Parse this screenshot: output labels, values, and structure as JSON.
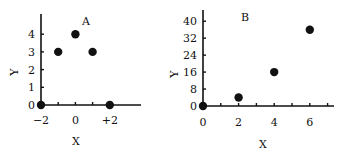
{
  "chart_data": [
    {
      "type": "scatter",
      "title": "A",
      "xlabel": "X",
      "ylabel": "Y",
      "x": [
        -2,
        -1,
        0,
        1,
        2
      ],
      "y": [
        0,
        3,
        4,
        3,
        0
      ],
      "xticks": [
        -2,
        -1,
        0,
        1,
        2
      ],
      "xtick_labels": [
        "-2",
        "",
        "0",
        "",
        "+2"
      ],
      "yticks": [
        0,
        1,
        2,
        3,
        4
      ],
      "ytick_labels": [
        "0",
        "1",
        "2",
        "3",
        "4"
      ],
      "xlim": [
        -2,
        3.2
      ],
      "ylim": [
        0,
        5
      ],
      "grid": false,
      "legend": null
    },
    {
      "type": "scatter",
      "title": "B",
      "xlabel": "X",
      "ylabel": "Y",
      "x": [
        0,
        2,
        4,
        6
      ],
      "y": [
        0,
        4,
        16,
        36
      ],
      "xticks": [
        0,
        1,
        2,
        3,
        4,
        5,
        6,
        7
      ],
      "xtick_labels": [
        "0",
        "",
        "2",
        "",
        "4",
        "",
        "6",
        ""
      ],
      "yticks": [
        0,
        8,
        16,
        24,
        32,
        40
      ],
      "ytick_labels": [
        "0",
        "8",
        "16",
        "24",
        "32",
        "40"
      ],
      "xlim": [
        0,
        7.5
      ],
      "ylim": [
        0,
        45
      ],
      "grid": false,
      "legend": null
    }
  ]
}
